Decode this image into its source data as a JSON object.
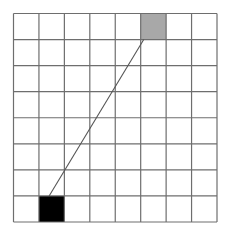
{
  "diagram": {
    "type": "grid-path",
    "rows": 8,
    "cols": 8,
    "grid_line_color": "#6e6e6e",
    "background_color": "#ffffff",
    "cells": [
      {
        "name": "start-cell",
        "row": 7,
        "col": 1,
        "fill": "#000000"
      },
      {
        "name": "goal-cell",
        "row": 0,
        "col": 5,
        "fill": "#a8a8a8"
      }
    ],
    "path": {
      "name": "connection-line",
      "color": "#555555",
      "from": {
        "row": 7,
        "col": 1,
        "anchor_frac_x": 0.4,
        "anchor_frac_y": 0.0
      },
      "to": {
        "row": 0,
        "col": 5,
        "anchor_frac_x": 0.12,
        "anchor_frac_y": 1.0
      }
    }
  }
}
